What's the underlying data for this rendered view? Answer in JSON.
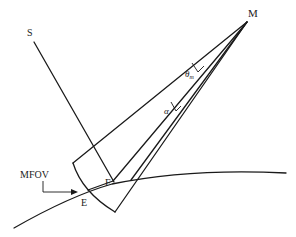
{
  "diagram": {
    "labels": {
      "M": "M",
      "S": "S",
      "E": "E",
      "F": "F",
      "MFOV": "MFOV",
      "theta": "θ",
      "theta_sub": "m",
      "alpha": "α"
    },
    "colors": {
      "stroke": "#1a1a1a",
      "text": "#222222",
      "background": "#ffffff"
    }
  }
}
